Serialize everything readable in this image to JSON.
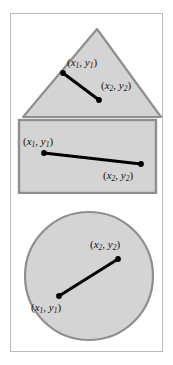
{
  "figure": {
    "frame": {
      "border_color": "#b9b9b9",
      "background": "#ffffff"
    },
    "style": {
      "shape_fill": "#d4d4d4",
      "shape_stroke": "#8f8f8f",
      "segment_color": "#000000",
      "label_color": "#111111"
    },
    "panels": [
      {
        "name": "triangle",
        "shape_type": "triangle",
        "segment": {
          "p1": {
            "label_open": "(",
            "x": "x",
            "x_sub": "1",
            "comma": ", ",
            "y": "y",
            "y_sub": "1",
            "label_close": ")"
          },
          "p2": {
            "label_open": "(",
            "x": "x",
            "x_sub": "2",
            "comma": ", ",
            "y": "y",
            "y_sub": "2",
            "label_close": ")"
          }
        }
      },
      {
        "name": "rectangle",
        "shape_type": "rectangle",
        "segment": {
          "p1": {
            "label_open": "(",
            "x": "x",
            "x_sub": "1",
            "comma": ", ",
            "y": "y",
            "y_sub": "1",
            "label_close": ")"
          },
          "p2": {
            "label_open": "(",
            "x": "x",
            "x_sub": "2",
            "comma": ", ",
            "y": "y",
            "y_sub": "2",
            "label_close": ")"
          }
        }
      },
      {
        "name": "circle",
        "shape_type": "circle",
        "segment": {
          "p1": {
            "label_open": "(",
            "x": "x",
            "x_sub": "1",
            "comma": ", ",
            "y": "y",
            "y_sub": "1",
            "label_close": ")"
          },
          "p2": {
            "label_open": "(",
            "x": "x",
            "x_sub": "2",
            "comma": ", ",
            "y": "y",
            "y_sub": "2",
            "label_close": ")"
          }
        }
      }
    ]
  }
}
